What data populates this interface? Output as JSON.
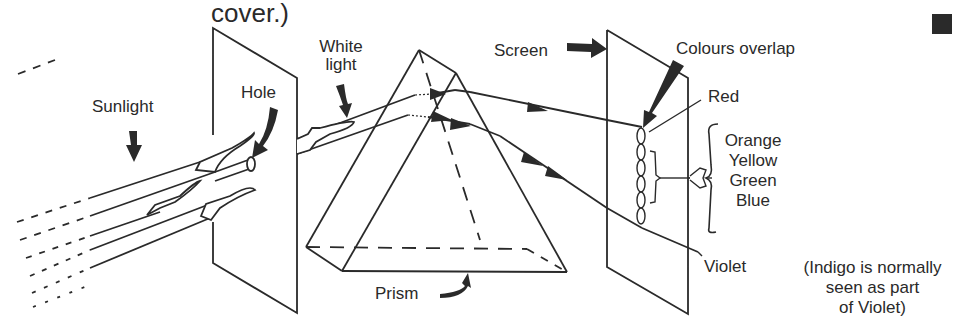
{
  "diagram": {
    "title_fragment": "cover.)",
    "labels": {
      "sunlight": "Sunlight",
      "hole": "Hole",
      "white_light": [
        "White",
        "light"
      ],
      "prism": "Prism",
      "screen": "Screen",
      "colours_overlap": "Colours overlap",
      "red": "Red",
      "middle_colours": [
        "Orange",
        "Yellow",
        "Green",
        "Blue"
      ],
      "violet": "Violet",
      "note": [
        "(Indigo is normally",
        "seen as part",
        "of Violet)"
      ]
    },
    "colors": {
      "ink": "#2a2a2a",
      "background": "#ffffff"
    },
    "icons": {
      "corner_marker": "square-bullet-icon"
    }
  }
}
